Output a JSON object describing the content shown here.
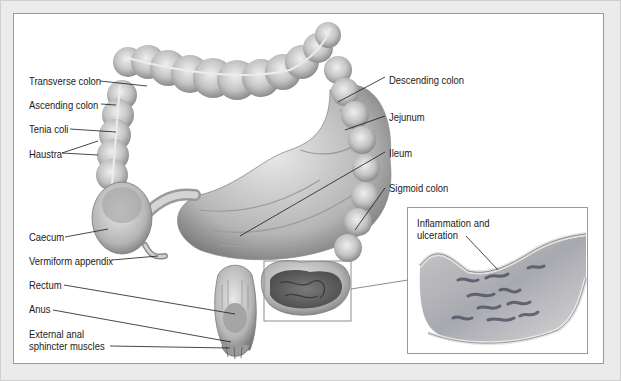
{
  "diagram": {
    "colors": {
      "background": "#ebebeb",
      "panel": "#ffffff",
      "border": "#9a9a9a",
      "tissue_light": "#d8d8d8",
      "tissue_mid": "#b0b0b0",
      "tissue_dark": "#6e6e6e",
      "ulceration": "#5a5a6a",
      "label_text": "#1a1a1a"
    },
    "labels_left": [
      {
        "id": "transverse-colon",
        "text": "Transverse colon"
      },
      {
        "id": "ascending-colon",
        "text": "Ascending colon"
      },
      {
        "id": "tenia-coli",
        "text": "Tenia coli"
      },
      {
        "id": "haustra",
        "text": "Haustra"
      },
      {
        "id": "caecum",
        "text": "Caecum"
      },
      {
        "id": "vermiform-appendix",
        "text": "Vermiform appendix"
      },
      {
        "id": "rectum",
        "text": "Rectum"
      },
      {
        "id": "anus",
        "text": "Anus"
      },
      {
        "id": "external-anal-sphincter-1",
        "text": "External anal"
      },
      {
        "id": "external-anal-sphincter-2",
        "text": "sphincter muscles"
      }
    ],
    "labels_right": [
      {
        "id": "descending-colon",
        "text": "Descending colon"
      },
      {
        "id": "jejunum",
        "text": "Jejunum"
      },
      {
        "id": "ileum",
        "text": "Ileum"
      },
      {
        "id": "sigmoid-colon",
        "text": "Sigmoid colon"
      }
    ],
    "inset": {
      "label_line1": "Inflammation and",
      "label_line2": "ulceration"
    }
  }
}
